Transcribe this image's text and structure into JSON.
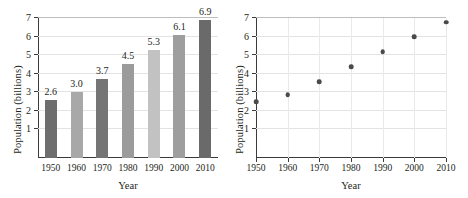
{
  "figure": {
    "panels": [
      "population-bar-chart",
      "population-scatter-plot"
    ]
  },
  "chart_data": [
    {
      "type": "bar",
      "title": "",
      "xlabel": "Year",
      "ylabel": "Population (billions)",
      "categories": [
        "1950",
        "1960",
        "1970",
        "1980",
        "1990",
        "2000",
        "2010"
      ],
      "values": [
        2.6,
        3.0,
        3.7,
        4.5,
        5.3,
        6.1,
        6.9
      ],
      "value_labels": [
        "2.6",
        "3.0",
        "3.7",
        "4.5",
        "5.3",
        "6.1",
        "6.9"
      ],
      "bar_colors": [
        "#6e6e6e",
        "#a8a8a8",
        "#757575",
        "#9b9b9b",
        "#c2c2c2",
        "#9e9e9e",
        "#6a6a6a"
      ],
      "ylim": [
        0,
        7
      ],
      "yticks": [
        "1",
        "2",
        "3",
        "4",
        "5",
        "6",
        "7"
      ],
      "ytick_values": [
        1,
        2,
        3,
        4,
        5,
        6,
        7
      ],
      "grid": "horizontal",
      "legend": "none"
    },
    {
      "type": "scatter",
      "title": "",
      "xlabel": "Year",
      "ylabel": "Population (billions)",
      "x": [
        1950,
        1960,
        1970,
        1980,
        1990,
        2000,
        2010
      ],
      "y": [
        2.6,
        3.0,
        3.7,
        4.5,
        5.3,
        6.1,
        6.9
      ],
      "xtick_labels": [
        "1950",
        "1960",
        "1970",
        "1980",
        "1990",
        "2000",
        "2010"
      ],
      "ylim": [
        0,
        7
      ],
      "xlim": [
        1950,
        2010
      ],
      "yticks": [
        "1",
        "2",
        "3",
        "4",
        "5",
        "6",
        "7"
      ],
      "ytick_values": [
        1,
        2,
        3,
        4,
        5,
        6,
        7
      ],
      "marker_color": "#4a4a4a",
      "grid": "both",
      "legend": "none"
    }
  ],
  "colors": {
    "axis": "#3b3b3b",
    "grid": "#e3e3e3",
    "text": "#231f20"
  }
}
